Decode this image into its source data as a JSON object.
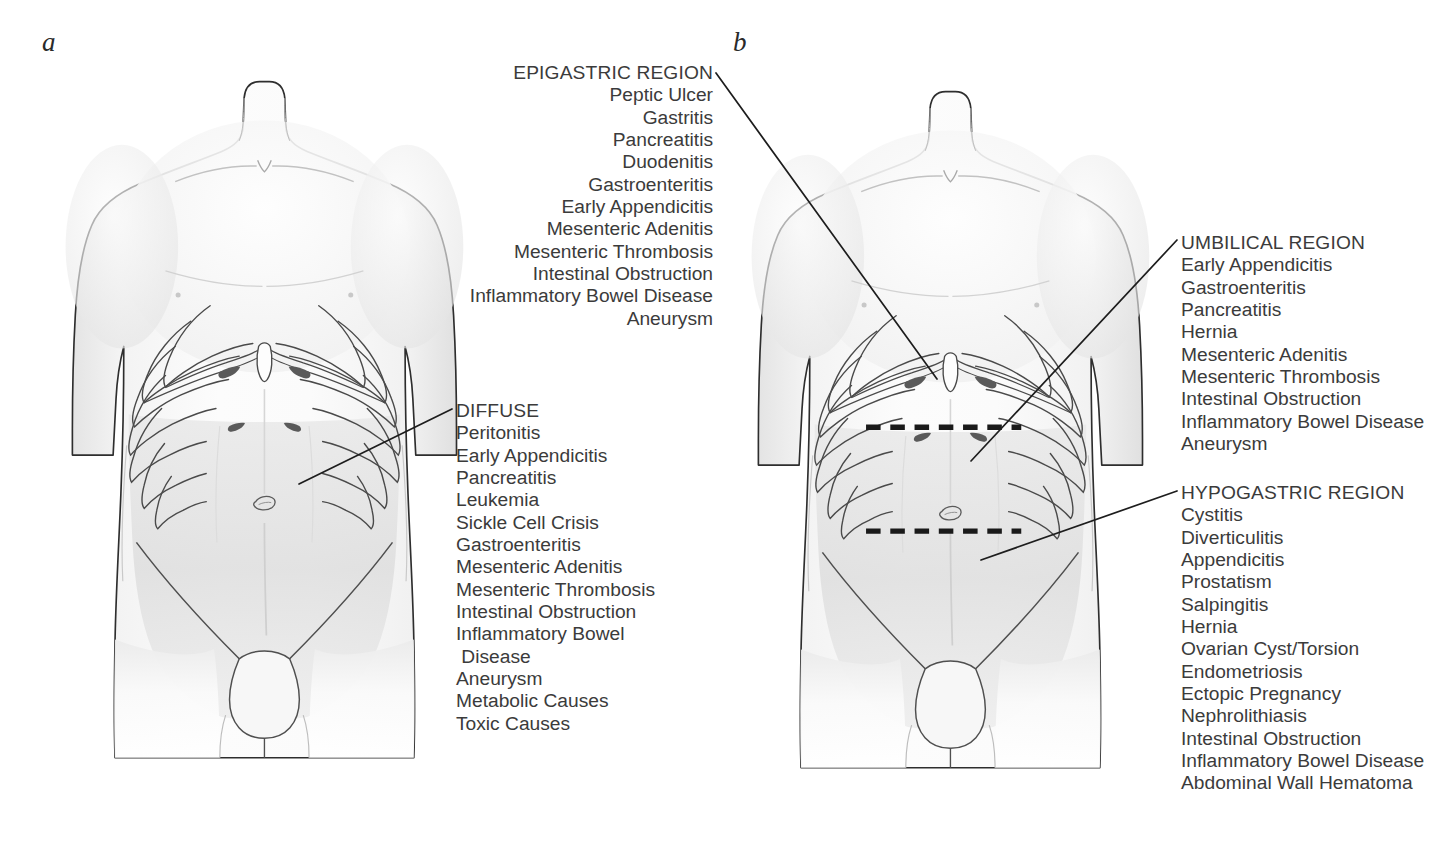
{
  "figure": {
    "panels": [
      {
        "letter": "a",
        "name": "diffuse-pain-panel"
      },
      {
        "letter": "b",
        "name": "regional-pain-panel"
      }
    ],
    "colors": {
      "ink": "#3b3b3b",
      "outline": "#2e2e2e",
      "skin_light": "#fbfbfb",
      "skin_shade": "#d8d8d8",
      "leader": "#1d1d1d",
      "dashes": "#1a1a1a"
    }
  },
  "callouts": {
    "epigastric": {
      "heading": "EPIGASTRIC REGION",
      "items": [
        "Peptic Ulcer",
        "Gastritis",
        "Pancreatitis",
        "Duodenitis",
        "Gastroenteritis",
        "Early Appendicitis",
        "Mesenteric Adenitis",
        "Mesenteric Thrombosis",
        "Intestinal Obstruction",
        "Inflammatory Bowel Disease",
        "Aneurysm"
      ]
    },
    "diffuse": {
      "heading": "DIFFUSE",
      "items": [
        "Peritonitis",
        "Early Appendicitis",
        "Pancreatitis",
        "Leukemia",
        "Sickle Cell Crisis",
        "Gastroenteritis",
        "Mesenteric Adenitis",
        "Mesenteric Thrombosis",
        "Intestinal Obstruction",
        "Inflammatory Bowel",
        " Disease",
        "Aneurysm",
        "Metabolic Causes",
        "Toxic Causes"
      ]
    },
    "umbilical": {
      "heading": "UMBILICAL REGION",
      "items": [
        "Early Appendicitis",
        "Gastroenteritis",
        "Pancreatitis",
        "Hernia",
        "Mesenteric Adenitis",
        "Mesenteric Thrombosis",
        "Intestinal Obstruction",
        "Inflammatory Bowel Disease",
        "Aneurysm"
      ]
    },
    "hypogastric": {
      "heading": "HYPOGASTRIC REGION",
      "items": [
        "Cystitis",
        "Diverticulitis",
        "Appendicitis",
        "Prostatism",
        "Salpingitis",
        "Hernia",
        "Ovarian Cyst/Torsion",
        "Endometriosis",
        "Ectopic Pregnancy",
        "Nephrolithiasis",
        "Intestinal Obstruction",
        "Inflammatory Bowel Disease",
        "Abdominal Wall Hematoma"
      ]
    }
  }
}
